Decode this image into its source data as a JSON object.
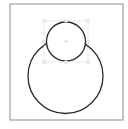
{
  "canvas": {
    "width": 128,
    "height": 129,
    "background": "#ffffff"
  },
  "frame": {
    "x": 10,
    "y": 4,
    "width": 113,
    "height": 116,
    "stroke": "#a0a0a0",
    "stroke_width": 1.2
  },
  "shapes": {
    "large_circle": {
      "cx": 65.5,
      "cy": 76,
      "r": 37.5,
      "stroke": "#2a2a2a",
      "stroke_width": 1.3,
      "fill": "none"
    },
    "small_circle": {
      "cx": 66,
      "cy": 41.5,
      "r": 19.5,
      "stroke": "#2a2a2a",
      "stroke_width": 1.3,
      "fill": "#ffffff"
    }
  },
  "selection": {
    "target": "small_circle",
    "x": 44,
    "y": 21,
    "width": 44,
    "height": 41,
    "stroke": "#d4d4d4",
    "handle_color": "#c8c8c8",
    "center_marker_color": "#cccccc"
  }
}
